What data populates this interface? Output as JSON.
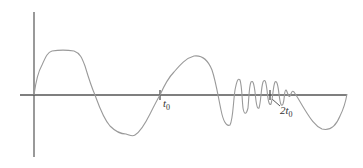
{
  "diagram": {
    "type": "signal-waveform",
    "colors": {
      "axis": "#555555",
      "curve": "#9a9a9a",
      "label": "#333333"
    },
    "labels": {
      "t0": {
        "main": "t",
        "sub": "0"
      },
      "two_t0": {
        "main": "2t",
        "sub": "0"
      }
    }
  }
}
